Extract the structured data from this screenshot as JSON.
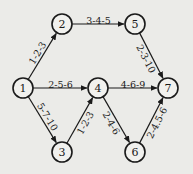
{
  "diagram": {
    "type": "activity-on-arrow network",
    "nodes": [
      {
        "id": "1",
        "label": "1",
        "x": 23,
        "y": 88
      },
      {
        "id": "2",
        "label": "2",
        "x": 62,
        "y": 24
      },
      {
        "id": "3",
        "label": "3",
        "x": 62,
        "y": 152
      },
      {
        "id": "4",
        "label": "4",
        "x": 98,
        "y": 88
      },
      {
        "id": "5",
        "label": "5",
        "x": 135,
        "y": 24
      },
      {
        "id": "6",
        "label": "6",
        "x": 135,
        "y": 152
      },
      {
        "id": "7",
        "label": "7",
        "x": 168,
        "y": 88
      }
    ],
    "edges": [
      {
        "from": "1",
        "to": "2",
        "label": "1-2-3"
      },
      {
        "from": "1",
        "to": "4",
        "label": "2-5-6"
      },
      {
        "from": "1",
        "to": "3",
        "label": "5-7-10"
      },
      {
        "from": "3",
        "to": "4",
        "label": "1-2-3"
      },
      {
        "from": "2",
        "to": "5",
        "label": "3-4-5"
      },
      {
        "from": "5",
        "to": "7",
        "label": "2-3-10"
      },
      {
        "from": "4",
        "to": "7",
        "label": "4-6-9"
      },
      {
        "from": "4",
        "to": "6",
        "label": "2-4-6"
      },
      {
        "from": "6",
        "to": "7",
        "label": "2-4.5-6"
      }
    ]
  }
}
